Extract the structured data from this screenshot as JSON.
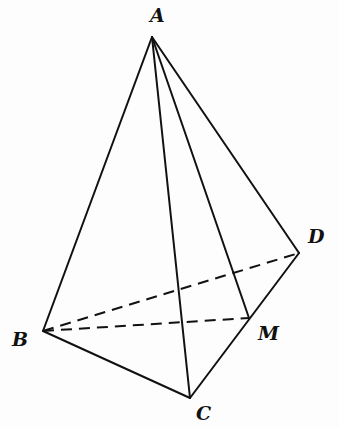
{
  "diagram": {
    "type": "tetrahedron",
    "points": {
      "A": {
        "label": "A"
      },
      "B": {
        "label": "B"
      },
      "C": {
        "label": "C"
      },
      "D": {
        "label": "D"
      },
      "M": {
        "label": "M"
      }
    },
    "solid_edges": [
      [
        "A",
        "B"
      ],
      [
        "A",
        "C"
      ],
      [
        "A",
        "D"
      ],
      [
        "A",
        "M"
      ],
      [
        "B",
        "C"
      ],
      [
        "C",
        "D"
      ]
    ],
    "dashed_edges": [
      [
        "B",
        "D"
      ],
      [
        "B",
        "M"
      ]
    ]
  }
}
